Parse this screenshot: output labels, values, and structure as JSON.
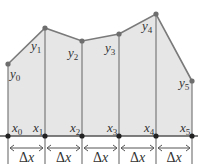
{
  "diagram": {
    "title": "",
    "colors": {
      "fill": "#e6e6e6",
      "line": "#7a7a7a",
      "point": "#6e6e6e",
      "text": "#333333"
    },
    "baseline_y": 136,
    "points": [
      {
        "x": 8,
        "y": 64,
        "y_label": "y",
        "y_sub": "0",
        "x_label": "x",
        "x_sub": "0"
      },
      {
        "x": 45,
        "y": 28,
        "y_label": "y",
        "y_sub": "1",
        "x_label": "x",
        "x_sub": "1"
      },
      {
        "x": 82,
        "y": 41,
        "y_label": "y",
        "y_sub": "2",
        "x_label": "x",
        "x_sub": "2"
      },
      {
        "x": 119,
        "y": 34,
        "y_label": "y",
        "y_sub": "3",
        "x_label": "x",
        "x_sub": "3"
      },
      {
        "x": 156,
        "y": 14,
        "y_label": "y",
        "y_sub": "4",
        "x_label": "x",
        "x_sub": "4"
      },
      {
        "x": 192,
        "y": 81,
        "y_label": "y",
        "y_sub": "5",
        "x_label": "x",
        "x_sub": "5"
      }
    ],
    "interval_label": "Δx",
    "interval_count": 5
  }
}
